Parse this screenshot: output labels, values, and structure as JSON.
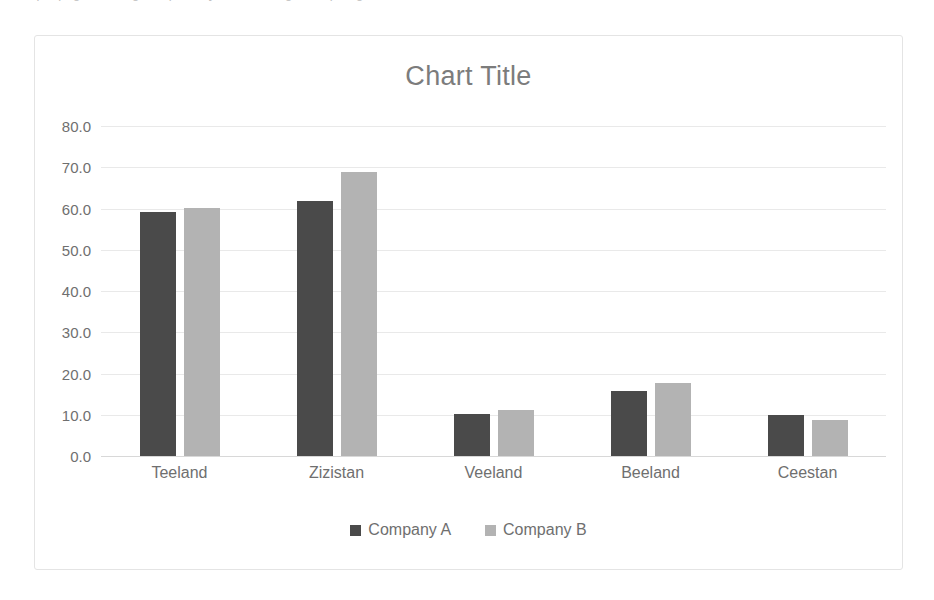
{
  "top_clipped_text": "a sample page heading text partially cut off along the top edge",
  "chart_data": {
    "type": "bar",
    "title": "Chart Title",
    "xlabel": "",
    "ylabel": "",
    "categories": [
      "Teeland",
      "Zizistan",
      "Veeland",
      "Beeland",
      "Ceestan"
    ],
    "series": [
      {
        "name": "Company A",
        "color": "#4a4a4a",
        "values": [
          59.2,
          61.8,
          10.2,
          15.7,
          10.0
        ]
      },
      {
        "name": "Company B",
        "color": "#b3b3b3",
        "values": [
          60.1,
          68.8,
          11.2,
          17.8,
          8.8
        ]
      }
    ],
    "ylim": [
      0,
      80
    ],
    "ytick_step": 10,
    "ytick_labels": [
      "80.0",
      "70.0",
      "60.0",
      "50.0",
      "40.0",
      "30.0",
      "20.0",
      "10.0",
      "0.0"
    ],
    "ytick_values": [
      80,
      70,
      60,
      50,
      40,
      30,
      20,
      10,
      0
    ],
    "grid": true,
    "legend_position": "bottom",
    "title_color": "#7c7c7c",
    "label_color": "#6f6f6f",
    "gridline_color": "#e9e9e9",
    "plot_background": "#ffffff",
    "frame_border_color": "#e4e4e4"
  }
}
